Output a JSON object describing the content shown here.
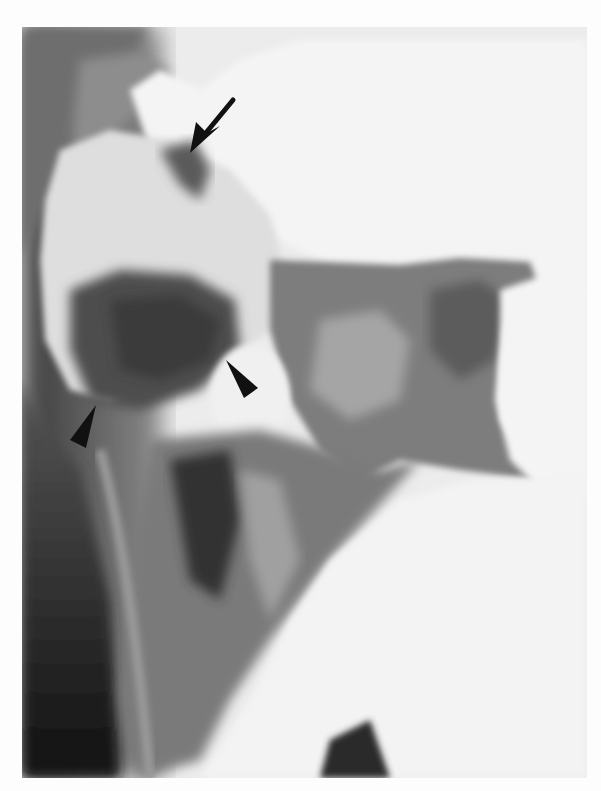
{
  "image": {
    "type": "radiograph",
    "description": "Barium enema X-ray of colon with annotation markers",
    "palette": {
      "background": "#fdfdfd",
      "barium_white": "#f2f2f2",
      "soft_tissue_gray": "#9a9a9a",
      "air_dark": "#4a4a4a",
      "deep_dark": "#1e1e1e",
      "marker": "#111111"
    }
  },
  "annotations": [
    {
      "kind": "arrow",
      "tail": [
        233,
        100
      ],
      "tip": [
        190,
        152
      ]
    },
    {
      "kind": "arrowhead",
      "tip": [
        226,
        361
      ],
      "direction": "up-left"
    },
    {
      "kind": "arrowhead",
      "tip": [
        96,
        405
      ],
      "direction": "up-right"
    }
  ]
}
